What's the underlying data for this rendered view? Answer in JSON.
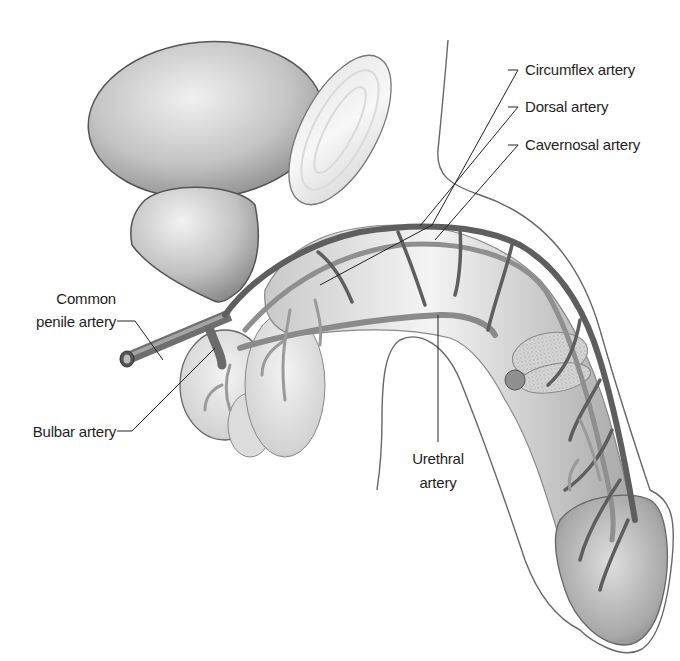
{
  "figure": {
    "colors": {
      "background": "#ffffff",
      "outline": "#555555",
      "artery_dark": "#5d5d5d",
      "artery_mid": "#8a8a8a",
      "organ_light": "#e4e4e4",
      "organ_mid": "#bdbdbd",
      "organ_dark": "#8f8f8f",
      "leader_line": "#222222",
      "label_text": "#1e1e1e"
    },
    "structures": [
      "bladder",
      "pubic-symphysis",
      "prostate",
      "bulb-of-penis",
      "testis",
      "corpus-cavernosum",
      "corpus-spongiosum",
      "glans",
      "skin-outline"
    ]
  },
  "labels": {
    "circumflex_artery": "Circumflex artery",
    "dorsal_artery": "Dorsal artery",
    "cavernosal_artery": "Cavernosal artery",
    "common_penile_artery_line1": "Common",
    "common_penile_artery_line2": "penile artery",
    "bulbar_artery": "Bulbar artery",
    "urethral_artery_line1": "Urethral",
    "urethral_artery_line2": "artery"
  }
}
